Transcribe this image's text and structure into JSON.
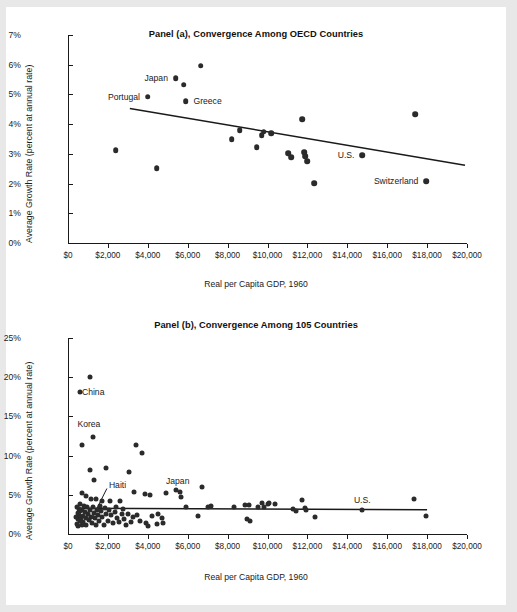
{
  "figure": {
    "background": "#ffffff",
    "page_border": "#e8e8e8",
    "dot_color": "#2b2b2b",
    "axis_color": "#1a1a1a"
  },
  "chart_data": [
    {
      "id": "panel-a",
      "type": "scatter",
      "title": "Panel (a), Convergence Among OECD Countries",
      "xlabel": "Real per Capita GDP, 1960",
      "ylabel": "Average Growth Rate (percent at annual rate)",
      "xlim": [
        0,
        20000
      ],
      "ylim": [
        0,
        7
      ],
      "xticks": [
        0,
        2000,
        4000,
        6000,
        8000,
        10000,
        12000,
        14000,
        16000,
        18000,
        20000
      ],
      "xticklabels": [
        "$0",
        "$2,000",
        "$4,000",
        "$6,000",
        "$8,000",
        "$10,000",
        "$12,000",
        "$14,000",
        "$16,000",
        "$18,000",
        "$20,000"
      ],
      "yticks": [
        0,
        1,
        2,
        3,
        4,
        5,
        6,
        7
      ],
      "yticklabels": [
        "0%",
        "1%",
        "2%",
        "3%",
        "4%",
        "5%",
        "6%",
        "7%"
      ],
      "grid": false,
      "legend": "none",
      "points": [
        {
          "x": 2400,
          "y": 3.12
        },
        {
          "x": 4000,
          "y": 4.93,
          "label": "Portugal",
          "label_side": "right"
        },
        {
          "x": 4450,
          "y": 2.52
        },
        {
          "x": 5400,
          "y": 5.55,
          "label": "Japan",
          "label_side": "right"
        },
        {
          "x": 5800,
          "y": 5.33
        },
        {
          "x": 5900,
          "y": 4.77,
          "label": "Greece",
          "label_side": "left"
        },
        {
          "x": 6650,
          "y": 5.97
        },
        {
          "x": 8200,
          "y": 3.5
        },
        {
          "x": 8600,
          "y": 3.8
        },
        {
          "x": 9450,
          "y": 3.22
        },
        {
          "x": 9700,
          "y": 3.62
        },
        {
          "x": 9800,
          "y": 3.75
        },
        {
          "x": 10200,
          "y": 3.7
        },
        {
          "x": 11050,
          "y": 3.02
        },
        {
          "x": 11200,
          "y": 2.88
        },
        {
          "x": 11750,
          "y": 4.17
        },
        {
          "x": 11850,
          "y": 3.05
        },
        {
          "x": 11900,
          "y": 2.92
        },
        {
          "x": 11980,
          "y": 2.75
        },
        {
          "x": 12350,
          "y": 2.02
        },
        {
          "x": 14750,
          "y": 2.95,
          "label": "U.S.",
          "label_side": "right"
        },
        {
          "x": 17400,
          "y": 4.33
        },
        {
          "x": 17950,
          "y": 2.08,
          "label": "Switzerland",
          "label_side": "right"
        }
      ],
      "fit_line": {
        "x1": 3100,
        "y1": 4.53,
        "x2": 19900,
        "y2": 2.62
      }
    },
    {
      "id": "panel-b",
      "type": "scatter",
      "title": "Panel (b), Convergence Among 105 Countries",
      "xlabel": "Real per Capita GDP, 1960",
      "ylabel": "Average Growth Rate (percent at annual rate)",
      "xlim": [
        0,
        20000
      ],
      "ylim": [
        0,
        25
      ],
      "xticks": [
        0,
        2000,
        4000,
        6000,
        8000,
        10000,
        12000,
        14000,
        16000,
        18000,
        20000
      ],
      "xticklabels": [
        "$0",
        "$2,000",
        "$4,000",
        "$6,000",
        "$8,000",
        "$10,000",
        "$12,000",
        "$14,000",
        "$16,000",
        "$18,000",
        "$20,000"
      ],
      "yticks": [
        0,
        5,
        10,
        15,
        20,
        25
      ],
      "yticklabels": [
        "0%",
        "5%",
        "10%",
        "15%",
        "20%",
        "25%"
      ],
      "grid": false,
      "legend": "none",
      "annotations": [
        {
          "text": "China",
          "x": 700,
          "y": 18.1,
          "side": "left"
        },
        {
          "text": "Korea",
          "x": 1050,
          "y": 14.0,
          "side": "center"
        },
        {
          "text": "Haiti",
          "x": 2050,
          "y": 6.2,
          "side": "left"
        },
        {
          "text": "Japan",
          "x": 5500,
          "y": 6.8,
          "side": "center"
        },
        {
          "text": "U.S.",
          "x": 14750,
          "y": 4.3,
          "side": "center"
        }
      ],
      "leader_line": {
        "x1": 1950,
        "y1": 5.8,
        "x2": 1180,
        "y2": 1.9
      },
      "points": [
        {
          "x": 620,
          "y": 18.05
        },
        {
          "x": 1080,
          "y": 20.05
        },
        {
          "x": 1250,
          "y": 12.4
        },
        {
          "x": 700,
          "y": 11.35
        },
        {
          "x": 3400,
          "y": 11.4
        },
        {
          "x": 3700,
          "y": 10.3
        },
        {
          "x": 1100,
          "y": 8.15
        },
        {
          "x": 1900,
          "y": 8.45
        },
        {
          "x": 3050,
          "y": 7.85
        },
        {
          "x": 1300,
          "y": 6.85
        },
        {
          "x": 700,
          "y": 5.25
        },
        {
          "x": 900,
          "y": 4.8
        },
        {
          "x": 1150,
          "y": 4.45
        },
        {
          "x": 1400,
          "y": 4.5
        },
        {
          "x": 1700,
          "y": 4.2
        },
        {
          "x": 2100,
          "y": 4.2
        },
        {
          "x": 2400,
          "y": 3.4
        },
        {
          "x": 2600,
          "y": 4.2
        },
        {
          "x": 2750,
          "y": 3.2
        },
        {
          "x": 3300,
          "y": 5.3
        },
        {
          "x": 3850,
          "y": 5.05
        },
        {
          "x": 4100,
          "y": 5.0
        },
        {
          "x": 4900,
          "y": 5.25
        },
        {
          "x": 5400,
          "y": 5.6
        },
        {
          "x": 5600,
          "y": 5.4
        },
        {
          "x": 5650,
          "y": 4.7
        },
        {
          "x": 6700,
          "y": 6.0
        },
        {
          "x": 6500,
          "y": 2.3
        },
        {
          "x": 5900,
          "y": 3.5
        },
        {
          "x": 7000,
          "y": 3.4
        },
        {
          "x": 7150,
          "y": 3.6
        },
        {
          "x": 8300,
          "y": 3.45
        },
        {
          "x": 8850,
          "y": 3.75
        },
        {
          "x": 9050,
          "y": 3.7
        },
        {
          "x": 8950,
          "y": 1.9
        },
        {
          "x": 9100,
          "y": 1.6
        },
        {
          "x": 9500,
          "y": 3.5
        },
        {
          "x": 9700,
          "y": 3.9
        },
        {
          "x": 9800,
          "y": 3.4
        },
        {
          "x": 10000,
          "y": 3.8
        },
        {
          "x": 10100,
          "y": 3.95
        },
        {
          "x": 10400,
          "y": 3.85
        },
        {
          "x": 11300,
          "y": 3.2
        },
        {
          "x": 11450,
          "y": 2.9
        },
        {
          "x": 11750,
          "y": 4.3
        },
        {
          "x": 11900,
          "y": 3.3
        },
        {
          "x": 11950,
          "y": 3.1
        },
        {
          "x": 12400,
          "y": 2.2
        },
        {
          "x": 14750,
          "y": 3.0
        },
        {
          "x": 17350,
          "y": 4.45
        },
        {
          "x": 17950,
          "y": 2.35
        },
        {
          "x": 4500,
          "y": 2.6
        },
        {
          "x": 4700,
          "y": 2.1
        },
        {
          "x": 4750,
          "y": 1.35
        },
        {
          "x": 4450,
          "y": 1.25
        },
        {
          "x": 4200,
          "y": 2.3
        },
        {
          "x": 4000,
          "y": 1.05
        },
        {
          "x": 3900,
          "y": 1.4
        },
        {
          "x": 3600,
          "y": 1.65
        },
        {
          "x": 3450,
          "y": 2.4
        },
        {
          "x": 3250,
          "y": 2.2
        },
        {
          "x": 3150,
          "y": 1.5
        },
        {
          "x": 3000,
          "y": 2.55
        },
        {
          "x": 2900,
          "y": 1.1
        },
        {
          "x": 2800,
          "y": 1.9
        },
        {
          "x": 2700,
          "y": 2.6
        },
        {
          "x": 2550,
          "y": 1.5
        },
        {
          "x": 2450,
          "y": 2.1
        },
        {
          "x": 2350,
          "y": 2.75
        },
        {
          "x": 2250,
          "y": 1.35
        },
        {
          "x": 2150,
          "y": 2.4
        },
        {
          "x": 2050,
          "y": 3.1
        },
        {
          "x": 1980,
          "y": 1.7
        },
        {
          "x": 1900,
          "y": 2.5
        },
        {
          "x": 1850,
          "y": 3.3
        },
        {
          "x": 1780,
          "y": 1.2
        },
        {
          "x": 1720,
          "y": 2.2
        },
        {
          "x": 1650,
          "y": 2.9
        },
        {
          "x": 1600,
          "y": 3.6
        },
        {
          "x": 1550,
          "y": 1.6
        },
        {
          "x": 1500,
          "y": 2.4
        },
        {
          "x": 1450,
          "y": 3.1
        },
        {
          "x": 1400,
          "y": 1.1
        },
        {
          "x": 1350,
          "y": 2.0
        },
        {
          "x": 1300,
          "y": 2.7
        },
        {
          "x": 1250,
          "y": 3.5
        },
        {
          "x": 1200,
          "y": 1.4
        },
        {
          "x": 1150,
          "y": 2.2
        },
        {
          "x": 1100,
          "y": 3.0
        },
        {
          "x": 1050,
          "y": 1.8
        },
        {
          "x": 1000,
          "y": 2.6
        },
        {
          "x": 960,
          "y": 3.4
        },
        {
          "x": 920,
          "y": 1.1
        },
        {
          "x": 880,
          "y": 2.0
        },
        {
          "x": 840,
          "y": 2.8
        },
        {
          "x": 800,
          "y": 3.6
        },
        {
          "x": 770,
          "y": 1.5
        },
        {
          "x": 740,
          "y": 2.3
        },
        {
          "x": 710,
          "y": 3.1
        },
        {
          "x": 680,
          "y": 1.2
        },
        {
          "x": 650,
          "y": 2.1
        },
        {
          "x": 620,
          "y": 2.9
        },
        {
          "x": 600,
          "y": 3.8
        },
        {
          "x": 580,
          "y": 1.6
        },
        {
          "x": 560,
          "y": 2.4
        },
        {
          "x": 540,
          "y": 3.2
        },
        {
          "x": 520,
          "y": 1.0
        },
        {
          "x": 500,
          "y": 1.9
        },
        {
          "x": 480,
          "y": 2.7
        },
        {
          "x": 460,
          "y": 3.5
        },
        {
          "x": 440,
          "y": 1.3
        },
        {
          "x": 420,
          "y": 2.2
        }
      ],
      "fit_line": {
        "x1": 400,
        "y1": 3.3,
        "x2": 18000,
        "y2": 3.1
      }
    }
  ]
}
